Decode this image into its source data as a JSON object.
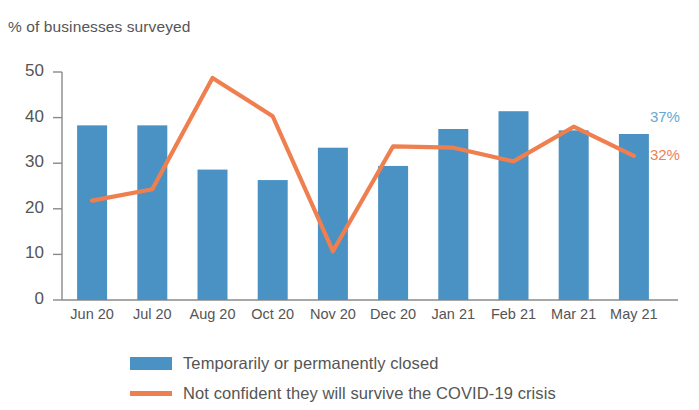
{
  "chart_data": {
    "type": "bar",
    "title": "",
    "subtitle": "",
    "ylabel": "% of businesses surveyed",
    "xlabel": "",
    "ylim": [
      0,
      50
    ],
    "yticks": [
      0,
      10,
      20,
      30,
      40,
      50
    ],
    "grid": false,
    "legend_position": "bottom",
    "categories": [
      "Jun 20",
      "Jul 20",
      "Aug 20",
      "Oct 20",
      "Nov 20",
      "Dec 20",
      "Jan 21",
      "Feb 21",
      "Mar 21",
      "May 21"
    ],
    "series": [
      {
        "name": "Temporarily or permanently closed",
        "type": "bar",
        "color": "#4a92c4",
        "values": [
          38.3,
          38.3,
          28.6,
          26.3,
          33.4,
          29.4,
          37.5,
          41.4,
          37.2,
          36.4
        ]
      },
      {
        "name": "Not confident they will survive the COVID-19 crisis",
        "type": "line",
        "color": "#ef7f4f",
        "values": [
          21.8,
          24.3,
          48.7,
          40.3,
          10.7,
          33.7,
          33.4,
          30.4,
          38.0,
          31.6
        ]
      }
    ],
    "annotations": [
      {
        "text": "37%",
        "series": "Temporarily or permanently closed",
        "category": "May 21",
        "color": "#66a8d4"
      },
      {
        "text": "32%",
        "series": "Not confident they will survive the COVID-19 crisis",
        "category": "May 21",
        "color": "#ef8055"
      }
    ]
  }
}
